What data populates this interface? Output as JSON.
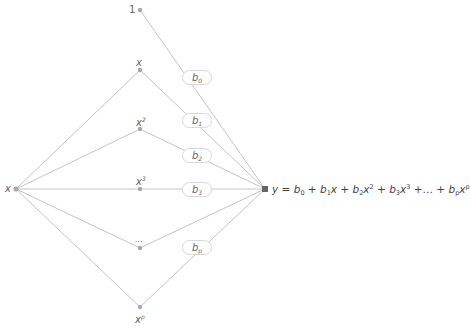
{
  "diagram": {
    "type": "polynomial-regression-network",
    "input_node": {
      "label": "x"
    },
    "bias_node": {
      "label": "1"
    },
    "feature_nodes": [
      {
        "base": "x",
        "exp": ""
      },
      {
        "base": "x",
        "exp": "2"
      },
      {
        "base": "x",
        "exp": "3"
      },
      {
        "base": "…",
        "exp": ""
      },
      {
        "base": "x",
        "exp": "p"
      }
    ],
    "weights": [
      {
        "base": "b",
        "sub": "0"
      },
      {
        "base": "b",
        "sub": "1"
      },
      {
        "base": "b",
        "sub": "2"
      },
      {
        "base": "b",
        "sub": "3"
      },
      {
        "base": "b",
        "sub": "p"
      }
    ],
    "output": {
      "y": "y",
      "eq": " = ",
      "terms": [
        {
          "coef": "b",
          "sub": "0",
          "var": "",
          "exp": "",
          "sep": " + "
        },
        {
          "coef": "b",
          "sub": "1",
          "var": "x",
          "exp": "",
          "sep": " + "
        },
        {
          "coef": "b",
          "sub": "2",
          "var": "x",
          "exp": "2",
          "sep": " + "
        },
        {
          "coef": "b",
          "sub": "3",
          "var": "x",
          "exp": "3",
          "sep": " +… + "
        },
        {
          "coef": "b",
          "sub": "p",
          "var": "x",
          "exp": "p",
          "sep": ""
        }
      ]
    },
    "colors": {
      "edge": "#b5b5b5",
      "node": "#a8a8a8",
      "output_node": "#666666",
      "box_border": "#d8d8d8"
    }
  }
}
